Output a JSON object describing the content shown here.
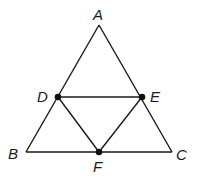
{
  "diagram": {
    "type": "geometry",
    "points": {
      "A": {
        "label": "A",
        "x": 99,
        "y": 25,
        "lx": 93,
        "ly": 20
      },
      "B": {
        "label": "B",
        "x": 26,
        "y": 152,
        "lx": 8,
        "ly": 159
      },
      "C": {
        "label": "C",
        "x": 172,
        "y": 152,
        "lx": 176,
        "ly": 160
      },
      "D": {
        "label": "D",
        "x": 58,
        "y": 97,
        "lx": 37,
        "ly": 102
      },
      "E": {
        "label": "E",
        "x": 142,
        "y": 97,
        "lx": 150,
        "ly": 102
      },
      "F": {
        "label": "F",
        "x": 99,
        "y": 152,
        "lx": 93,
        "ly": 172
      }
    },
    "segments": [
      [
        "A",
        "B"
      ],
      [
        "A",
        "C"
      ],
      [
        "B",
        "C"
      ],
      [
        "D",
        "E"
      ],
      [
        "D",
        "F"
      ],
      [
        "E",
        "F"
      ]
    ],
    "marked_points": [
      "D",
      "E",
      "F"
    ],
    "colors": {
      "stroke": "#1a1a1a",
      "point": "#111111",
      "background": "#ffffff"
    }
  }
}
